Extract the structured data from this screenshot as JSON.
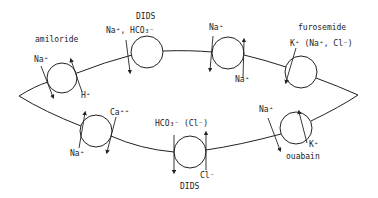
{
  "diagram": {
    "labels": {
      "amiloride": "amiloride",
      "na_top_left": "Na⁺",
      "h_plus": "H⁺",
      "dids_top": "DIDS",
      "na_hco3": "Na⁺, HCO₃⁻",
      "na_top_mid": "Na⁺",
      "na_top_mid_out": "Na⁺",
      "furosemide": "furosemide",
      "k_na_cl": "K⁺ (Na⁺, Cl⁻)",
      "ca": "Ca⁺⁺",
      "na_bottom_left": "Na⁺",
      "hco3_cl": "HCO₃⁻ (Cl⁻)",
      "cl_minus": "Cl⁻",
      "dids_bottom": "DIDS",
      "na_bottom_right": "Na⁺",
      "k_plus": "K⁺",
      "ouabain": "ouabain"
    },
    "transporters": [
      {
        "id": "na-h-exchanger",
        "inhibitor": "amiloride",
        "ions": [
          "Na⁺",
          "H⁺"
        ]
      },
      {
        "id": "na-hco3-cotransporter",
        "inhibitor": "DIDS",
        "ions": [
          "Na⁺",
          "HCO₃⁻"
        ]
      },
      {
        "id": "na-channel-top",
        "inhibitor": "",
        "ions": [
          "Na⁺",
          "Na⁺"
        ]
      },
      {
        "id": "k-na-cl-cotransporter",
        "inhibitor": "furosemide",
        "ions": [
          "K⁺",
          "Na⁺",
          "Cl⁻"
        ]
      },
      {
        "id": "na-k-atpase",
        "inhibitor": "ouabain",
        "ions": [
          "Na⁺",
          "K⁺"
        ]
      },
      {
        "id": "hco3-cl-exchanger",
        "inhibitor": "DIDS",
        "ions": [
          "HCO₃⁻",
          "Cl⁻"
        ]
      },
      {
        "id": "na-ca-exchanger",
        "inhibitor": "",
        "ions": [
          "Ca⁺⁺",
          "Na⁺"
        ]
      }
    ]
  }
}
